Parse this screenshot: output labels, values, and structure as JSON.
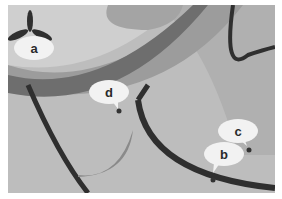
{
  "figure": {
    "labels": [
      {
        "id": "a",
        "text": "a"
      },
      {
        "id": "b",
        "text": "b"
      },
      {
        "id": "c",
        "text": "c"
      },
      {
        "id": "d",
        "text": "d"
      }
    ],
    "colors": {
      "background": "#bdbdbd",
      "light_region": "#e6e6e6",
      "mid_band": "#a8a8a8",
      "dark_band": "#6e6e6e",
      "outline": "#2f2f2f",
      "callout_fill": "#f2f2f2",
      "marker": "#333333"
    }
  }
}
